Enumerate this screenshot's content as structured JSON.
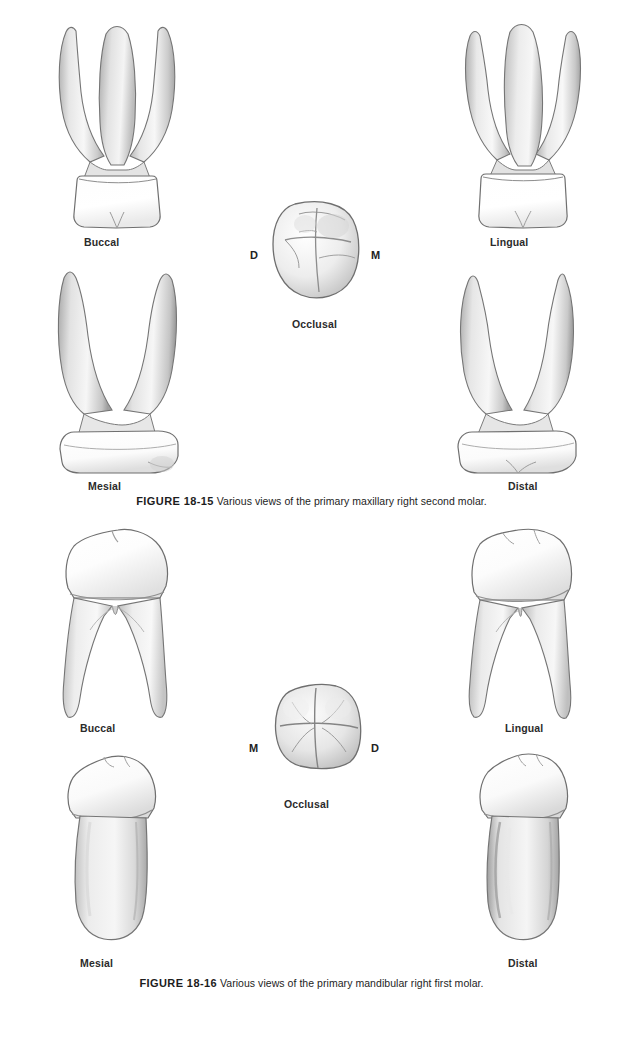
{
  "page": {
    "background": "#ffffff",
    "width": 623,
    "height": 1040,
    "text_color": "#1d1d1d"
  },
  "figures": [
    {
      "id": "figure-18-15",
      "number": "FIGURE 18-15",
      "caption_text": "Various views of the primary maxillary right second molar.",
      "caption_full": "FIGURE 18-15 Various views of the primary maxillary right second molar.",
      "tooth": "primary maxillary right second molar",
      "root_count": 3,
      "views": [
        {
          "key": "buccal",
          "label": "Buccal",
          "position": "top-left"
        },
        {
          "key": "lingual",
          "label": "Lingual",
          "position": "top-right"
        },
        {
          "key": "mesial",
          "label": "Mesial",
          "position": "bottom-left"
        },
        {
          "key": "distal",
          "label": "Distal",
          "position": "bottom-right"
        },
        {
          "key": "occlusal",
          "label": "Occlusal",
          "position": "center"
        }
      ],
      "occlusal_markers": {
        "left": "D",
        "right": "M",
        "left_meaning": "Distal",
        "right_meaning": "Mesial"
      }
    },
    {
      "id": "figure-18-16",
      "number": "FIGURE 18-16",
      "caption_text": "Various views of the primary mandibular right first molar.",
      "caption_full": "FIGURE 18-16 Various views of the primary mandibular right first molar.",
      "tooth": "primary mandibular right first molar",
      "root_count": 2,
      "views": [
        {
          "key": "buccal",
          "label": "Buccal",
          "position": "top-left"
        },
        {
          "key": "lingual",
          "label": "Lingual",
          "position": "top-right"
        },
        {
          "key": "mesial",
          "label": "Mesial",
          "position": "bottom-left"
        },
        {
          "key": "distal",
          "label": "Distal",
          "position": "bottom-right"
        },
        {
          "key": "occlusal",
          "label": "Occlusal",
          "position": "center"
        }
      ],
      "occlusal_markers": {
        "left": "M",
        "right": "D",
        "left_meaning": "Mesial",
        "right_meaning": "Distal"
      }
    }
  ],
  "colors": {
    "outline": "#6d6d6d",
    "enamel_light": "#ffffff",
    "enamel_shadow": "#d8d8d8",
    "root_light": "#f2f2f2",
    "root_mid": "#cfcfcf",
    "root_shadow": "#9a9a9a",
    "occlusal_groove": "#8f8f8f"
  }
}
